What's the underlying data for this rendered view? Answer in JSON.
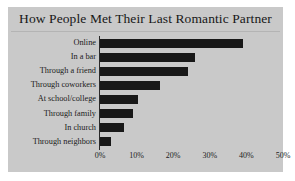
{
  "figure": {
    "background_color": "#c9c9c9",
    "page_background_color": "#ffffff"
  },
  "chart_data": {
    "type": "bar",
    "orientation": "horizontal",
    "title": "How People Met Their Last Romantic Partner",
    "subtitle": "",
    "xlabel": "",
    "ylabel": "",
    "categories": [
      "Online",
      "In a bar",
      "Through a friend",
      "Through coworkers",
      "At school/college",
      "Through family",
      "In church",
      "Through neighbors"
    ],
    "values": [
      39,
      26,
      24,
      16.5,
      10.5,
      9,
      6.5,
      3
    ],
    "value_unit": "%",
    "xlim": [
      0,
      50
    ],
    "xticks": [
      0,
      10,
      20,
      30,
      40,
      50
    ],
    "xtick_labels": [
      "0%",
      "10%",
      "20%",
      "30%",
      "40%",
      "50%"
    ],
    "grid": false,
    "legend": false,
    "legend_position": "none",
    "bar_color": "#181818",
    "axis_color": "#2a2a2a"
  }
}
